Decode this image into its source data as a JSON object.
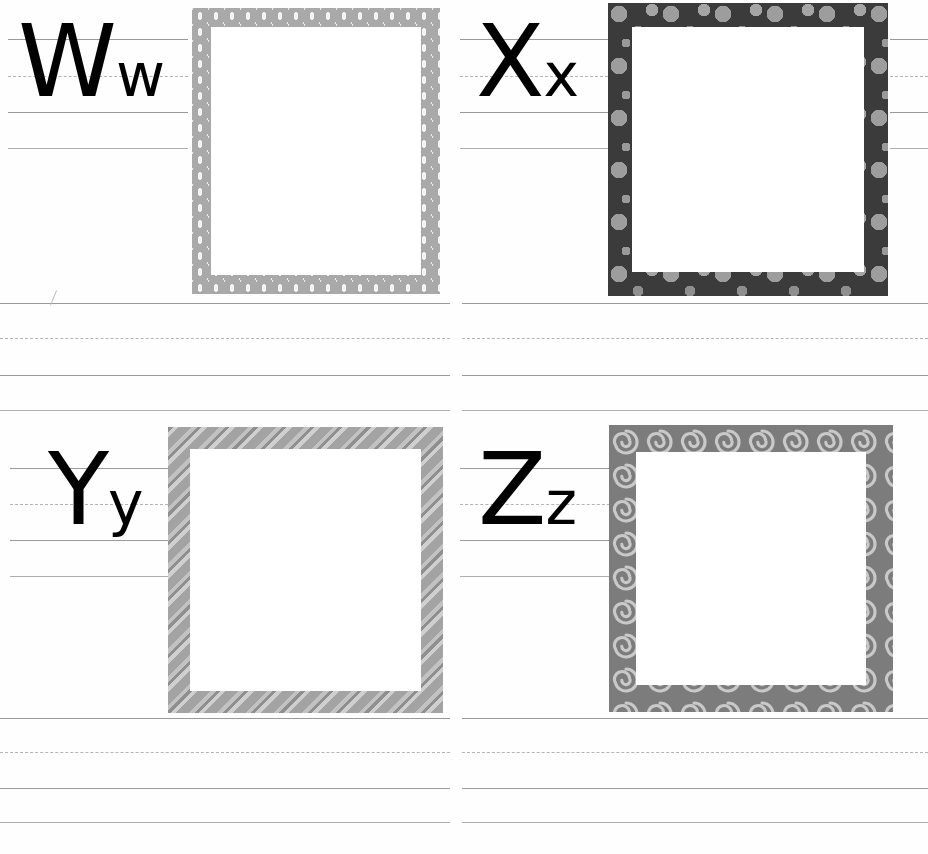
{
  "worksheet": {
    "title": "Alphabet Handwriting Practice Worksheet",
    "description": "Four-quadrant letter tracing page with picture frames",
    "page_width": 928,
    "page_height": 854,
    "gutter_x": 452
  },
  "ruling": {
    "solid_color": "#9a9a9a",
    "dashed_color": "#b4b4b4",
    "bands": [
      {
        "name": "row-1-letter-band",
        "top": 39,
        "mid": 76,
        "base": 112,
        "descender": 148
      },
      {
        "name": "row-1-practice-band",
        "top": 303,
        "mid": 338,
        "base": 375,
        "descender": 410
      },
      {
        "name": "row-2-letter-band",
        "top": 468,
        "mid": 504,
        "base": 540,
        "descender": 576
      },
      {
        "name": "row-2-practice-band",
        "top": 718,
        "mid": 752,
        "base": 788,
        "descender": 822
      }
    ]
  },
  "quadrants": [
    {
      "id": "quadrant-w",
      "letter_upper": "W",
      "letter_lower": "w",
      "letter_pair": "Ww",
      "letter_x": 18,
      "letter_baseline": 112,
      "frame": {
        "name": "frame-diamond",
        "pattern": "diamond",
        "base_color": "#a9a9a9",
        "accent_color": "#f4f4f4",
        "x": 192,
        "y": 8,
        "width": 248,
        "height": 286,
        "border": 19
      }
    },
    {
      "id": "quadrant-x",
      "letter_upper": "X",
      "letter_lower": "x",
      "letter_pair": "Xx",
      "letter_x": 476,
      "letter_baseline": 112,
      "frame": {
        "name": "frame-polka-dot",
        "pattern": "dots",
        "base_color": "#3b3b3b",
        "accent_color": "#9d9d9d",
        "x": 608,
        "y": 3,
        "width": 280,
        "height": 293,
        "border": 24
      }
    },
    {
      "id": "quadrant-y",
      "letter_upper": "Y",
      "letter_lower": "y",
      "letter_pair": "Yy",
      "letter_x": 48,
      "letter_baseline": 540,
      "frame": {
        "name": "frame-diagonal-stripe",
        "pattern": "stripes",
        "base_color": "#a3a3a3",
        "accent_color": "#cfcfcf",
        "x": 168,
        "y": 427,
        "width": 275,
        "height": 286,
        "border": 22
      }
    },
    {
      "id": "quadrant-z",
      "letter_upper": "Z",
      "letter_lower": "z",
      "letter_pair": "Zz",
      "letter_x": 478,
      "letter_baseline": 540,
      "frame": {
        "name": "frame-swirl",
        "pattern": "swirls",
        "base_color": "#7c7c7c",
        "accent_color": "#cfcfcf",
        "x": 609,
        "y": 425,
        "width": 284,
        "height": 287,
        "border": 27
      }
    }
  ]
}
